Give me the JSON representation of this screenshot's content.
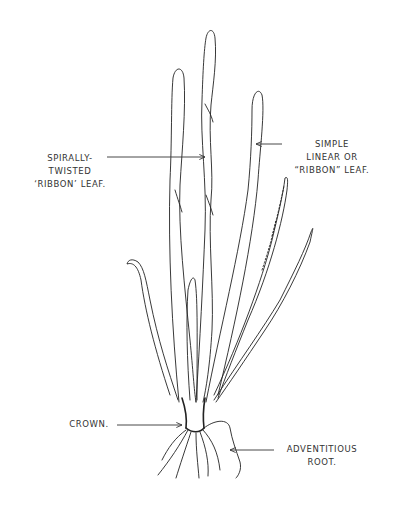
{
  "figure": {
    "line_color": "#222222",
    "background": "#ffffff"
  },
  "labels": {
    "spiral_leaf": {
      "line1": "SPIRALLY-",
      "line2": "TWISTED",
      "line3": "‘RIBBON’ LEAF."
    },
    "simple_leaf": {
      "line1": "SIMPLE",
      "line2": "LINEAR OR",
      "line3": "“RIBBON” LEAF."
    },
    "crown": {
      "line1": "CROWN."
    },
    "root": {
      "line1": "ADVENTITIOUS",
      "line2": "ROOT."
    }
  }
}
